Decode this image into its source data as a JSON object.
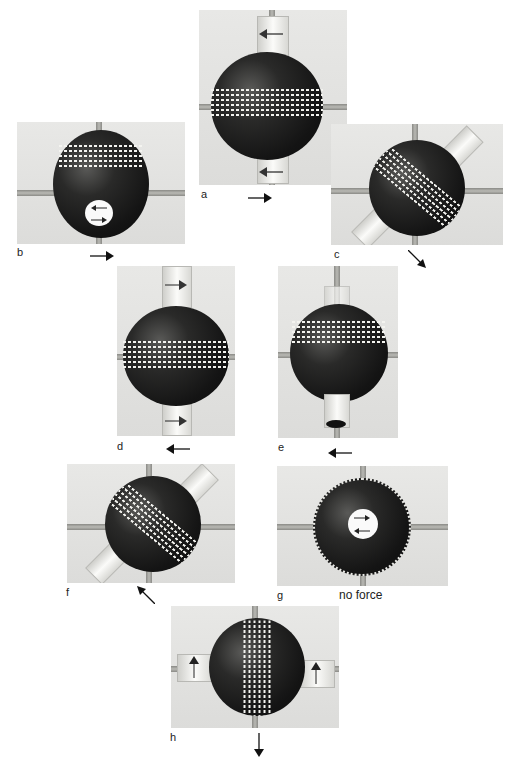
{
  "figure": {
    "panels": [
      {
        "id": "a",
        "label": "a",
        "force_direction": "right",
        "view": "seam horizontal, tubes top and bottom"
      },
      {
        "id": "b",
        "label": "b",
        "force_direction": "right",
        "view": "tilted, tube opening at bottom"
      },
      {
        "id": "c",
        "label": "c",
        "force_direction": "down-right",
        "view": "seam diagonal, tubes diagonal"
      },
      {
        "id": "d",
        "label": "d",
        "force_direction": "left",
        "view": "seam horizontal, tubes top and bottom"
      },
      {
        "id": "e",
        "label": "e",
        "force_direction": "left",
        "view": "tilted, tube at bottom"
      },
      {
        "id": "f",
        "label": "f",
        "force_direction": "up-left",
        "view": "seam diagonal, tubes diagonal"
      },
      {
        "id": "g",
        "label": "g",
        "force_direction": "none",
        "caption": "no force",
        "view": "end-on view, seam around rim"
      },
      {
        "id": "h",
        "label": "h",
        "force_direction": "down",
        "view": "seam vertical, tubes left and right"
      }
    ]
  },
  "colors": {
    "background": "#ffffff",
    "panel": "#e2e2e0",
    "ball": "#141414",
    "seam": "#f4f4f0",
    "rod": "#a0a09c"
  }
}
